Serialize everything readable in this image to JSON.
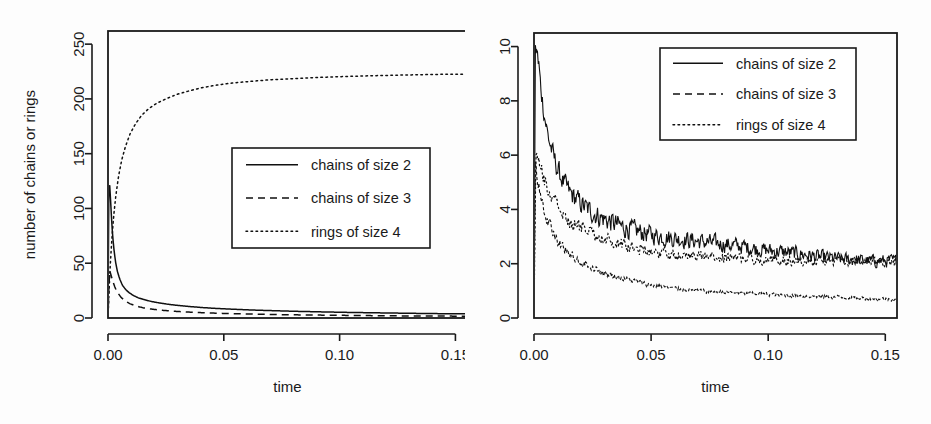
{
  "figure": {
    "background": "#fdfdfd",
    "ink_color": "#1a1a1a",
    "panel_count": 2
  },
  "chart_data": [
    {
      "type": "line",
      "panel": "left",
      "title": "",
      "xlabel": "time",
      "ylabel": "number of chains or rings",
      "xlim": [
        0,
        0.155
      ],
      "ylim": [
        0,
        262
      ],
      "xticks": [
        0.0,
        0.05,
        0.1,
        0.15
      ],
      "xticklabels": [
        "0.00",
        "0.05",
        "0.10",
        "0.15"
      ],
      "yticks": [
        0,
        50,
        100,
        150,
        200,
        250
      ],
      "yticklabels": [
        "0",
        "50",
        "100",
        "150",
        "200",
        "250"
      ],
      "grid": false,
      "legend_position": "center",
      "series": [
        {
          "name": "chains of size 2",
          "style": "solid",
          "x": [
            0.0,
            0.0004,
            0.0008,
            0.0012,
            0.0016,
            0.002,
            0.0026,
            0.0032,
            0.004,
            0.005,
            0.0062,
            0.0076,
            0.0092,
            0.011,
            0.013,
            0.0155,
            0.0185,
            0.022,
            0.026,
            0.0305,
            0.0355,
            0.041,
            0.047,
            0.054,
            0.062,
            0.071,
            0.081,
            0.092,
            0.104,
            0.117,
            0.13,
            0.142,
            0.15
          ],
          "y": [
            0,
            128,
            120,
            104,
            88,
            75,
            62,
            52,
            43,
            36,
            30,
            26,
            23,
            20.5,
            18.5,
            16.8,
            15.2,
            13.8,
            12.5,
            11.4,
            10.4,
            9.5,
            8.7,
            8.0,
            7.3,
            6.7,
            6.1,
            5.6,
            5.1,
            4.7,
            4.3,
            4.0,
            3.8
          ]
        },
        {
          "name": "chains of size 3",
          "style": "dashed",
          "x": [
            0.0,
            0.0006,
            0.0012,
            0.002,
            0.003,
            0.0042,
            0.0056,
            0.0074,
            0.0095,
            0.012,
            0.015,
            0.0185,
            0.0225,
            0.0275,
            0.033,
            0.04,
            0.048,
            0.057,
            0.068,
            0.08,
            0.093,
            0.107,
            0.122,
            0.138,
            0.15
          ],
          "y": [
            0,
            44,
            40,
            34,
            28,
            23,
            19,
            15.5,
            13,
            11,
            9.4,
            8.2,
            7.2,
            6.3,
            5.6,
            4.9,
            4.3,
            3.8,
            3.3,
            2.9,
            2.6,
            2.3,
            2.0,
            1.8,
            1.7
          ]
        },
        {
          "name": "rings of size 4",
          "style": "dotted",
          "x": [
            0.0,
            0.0008,
            0.0016,
            0.0024,
            0.0034,
            0.0046,
            0.006,
            0.0076,
            0.0095,
            0.0118,
            0.0145,
            0.0175,
            0.021,
            0.025,
            0.0295,
            0.0345,
            0.04,
            0.0465,
            0.0535,
            0.0615,
            0.07,
            0.0795,
            0.0895,
            0.1,
            0.111,
            0.123,
            0.135,
            0.143,
            0.15
          ],
          "y": [
            0,
            42,
            70,
            92,
            112,
            130,
            145,
            157,
            168,
            177,
            185,
            191,
            196,
            200,
            204,
            207,
            210,
            212.5,
            214.5,
            216,
            217.5,
            218.5,
            219.5,
            220.3,
            221,
            221.6,
            222.1,
            222.4,
            222.6
          ]
        }
      ]
    },
    {
      "type": "line",
      "panel": "right",
      "title": "",
      "xlabel": "time",
      "ylabel": "",
      "xlim": [
        0,
        0.155
      ],
      "ylim": [
        0,
        10.5
      ],
      "xticks": [
        0.0,
        0.05,
        0.1,
        0.15
      ],
      "xticklabels": [
        "0.00",
        "0.05",
        "0.10",
        "0.15"
      ],
      "yticks": [
        0,
        2,
        4,
        6,
        8,
        10
      ],
      "yticklabels": [
        "0",
        "2",
        "4",
        "6",
        "8",
        "10"
      ],
      "grid": false,
      "legend_position": "top-right",
      "noise": true,
      "series": [
        {
          "name": "chains of size 2",
          "style": "solid",
          "noise_amp": 0.22,
          "x": [
            0.0,
            0.0006,
            0.0012,
            0.0018,
            0.0026,
            0.0035,
            0.0046,
            0.006,
            0.0078,
            0.01,
            0.0125,
            0.0155,
            0.019,
            0.023,
            0.0275,
            0.0325,
            0.038,
            0.044,
            0.051,
            0.059,
            0.068,
            0.078,
            0.088,
            0.099,
            0.11,
            0.122,
            0.134,
            0.144,
            0.15
          ],
          "y": [
            0,
            10.0,
            9.6,
            9.2,
            8.7,
            8.1,
            7.4,
            6.7,
            6.1,
            5.5,
            5.0,
            4.6,
            4.3,
            4.0,
            3.75,
            3.55,
            3.35,
            3.2,
            3.05,
            2.95,
            2.85,
            2.75,
            2.65,
            2.5,
            2.4,
            2.25,
            2.15,
            2.1,
            2.1
          ]
        },
        {
          "name": "chains of size 3",
          "style": "dashed",
          "noise_amp": 0.14,
          "x": [
            0.0,
            0.0006,
            0.0012,
            0.002,
            0.003,
            0.0042,
            0.0058,
            0.0078,
            0.0102,
            0.013,
            0.0165,
            0.0205,
            0.025,
            0.03,
            0.036,
            0.043,
            0.051,
            0.06,
            0.07,
            0.081,
            0.093,
            0.106,
            0.12,
            0.135,
            0.15
          ],
          "y": [
            0,
            5.6,
            5.2,
            4.8,
            4.4,
            4.0,
            3.6,
            3.2,
            2.85,
            2.55,
            2.3,
            2.05,
            1.85,
            1.65,
            1.5,
            1.35,
            1.2,
            1.1,
            1.0,
            0.95,
            0.9,
            0.85,
            0.8,
            0.75,
            0.7
          ]
        },
        {
          "name": "rings of size 4",
          "style": "dotted",
          "noise_amp": 0.16,
          "x": [
            0.0,
            0.0008,
            0.0016,
            0.0026,
            0.0038,
            0.0052,
            0.007,
            0.0092,
            0.0118,
            0.015,
            0.0188,
            0.0232,
            0.0282,
            0.034,
            0.0405,
            0.048,
            0.0565,
            0.066,
            0.0765,
            0.088,
            0.1,
            0.113,
            0.127,
            0.142,
            0.15
          ],
          "y": [
            0,
            6.2,
            6.0,
            5.7,
            5.3,
            4.9,
            4.5,
            4.2,
            3.9,
            3.6,
            3.35,
            3.15,
            2.95,
            2.8,
            2.65,
            2.5,
            2.4,
            2.3,
            2.25,
            2.2,
            2.15,
            2.1,
            2.1,
            2.05,
            2.05
          ]
        }
      ]
    }
  ],
  "legend": {
    "entries": [
      {
        "label": "chains of size 2",
        "style": "solid"
      },
      {
        "label": "chains of size 3",
        "style": "dashed"
      },
      {
        "label": "rings of size 4",
        "style": "dotted"
      }
    ]
  }
}
